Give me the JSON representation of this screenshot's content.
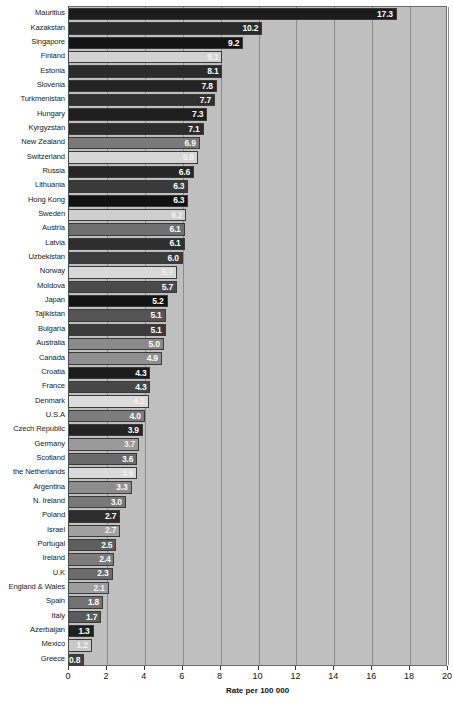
{
  "chart_data": {
    "type": "bar",
    "orientation": "horizontal",
    "title": "",
    "xlabel": "Rate per 100 000",
    "ylabel": "",
    "xlim": [
      0,
      20
    ],
    "xticks": [
      0,
      2,
      4,
      6,
      8,
      10,
      12,
      14,
      16,
      18,
      20
    ],
    "grid": true,
    "legend": "none",
    "categories": [
      "Mauritius",
      "Kazakstan",
      "Singapore",
      "Finland",
      "Estonia",
      "Slovenia",
      "Turkmenistan",
      "Hungary",
      "Kyrgyzstan",
      "New Zealand",
      "Switzerland",
      "Russia",
      "Lithuania",
      "Hong Kong",
      "Sweden",
      "Austria",
      "Latvia",
      "Uzbekistan",
      "Norway",
      "Moldova",
      "Japan",
      "Tajikistan",
      "Bulgaria",
      "Australia",
      "Canada",
      "Croatia",
      "France",
      "Denmark",
      "U.S.A",
      "Czech Republic",
      "Germany",
      "Scotland",
      "the Netherlands",
      "Argentina",
      "N. Ireland",
      "Poland",
      "Israel",
      "Portugal",
      "Ireland",
      "U.K",
      "England & Wales",
      "Spain",
      "Italy",
      "Azerbaijan",
      "Mexico",
      "Greece"
    ],
    "values": [
      17.3,
      10.2,
      9.2,
      8.1,
      8.1,
      7.8,
      7.7,
      7.3,
      7.1,
      6.9,
      6.8,
      6.6,
      6.3,
      6.3,
      6.2,
      6.1,
      6.1,
      6.0,
      5.7,
      5.7,
      5.2,
      5.1,
      5.1,
      5.0,
      4.9,
      4.3,
      4.3,
      4.2,
      4.0,
      3.9,
      3.7,
      3.6,
      3.6,
      3.3,
      3.0,
      2.7,
      2.7,
      2.5,
      2.4,
      2.3,
      2.1,
      1.8,
      1.7,
      1.3,
      1.2,
      0.8
    ],
    "value_labels": [
      "17.3",
      "10.2",
      "9.2",
      "8.1",
      "8.1",
      "7.8",
      "7.7",
      "7.3",
      "7.1",
      "6.9",
      "6.8",
      "6.6",
      "6.3",
      "6.3",
      "6.2",
      "6.1",
      "6.1",
      "6.0",
      "5.7",
      "5.7",
      "5.2",
      "5.1",
      "5.1",
      "5.0",
      "4.9",
      "4.3",
      "4.3",
      "4.2",
      "4.0",
      "3.9",
      "3.7",
      "3.6",
      "3.6",
      "3.3",
      "3.0",
      "2.7",
      "2.7",
      "2.5",
      "2.4",
      "2.3",
      "2.1",
      "1.8",
      "1.7",
      "1.3",
      "1.2",
      "0.8"
    ],
    "bar_colors": [
      "#1c1c1c",
      "#2a2a2a",
      "#141414",
      "#d2d2d2",
      "#2b2b2b",
      "#242424",
      "#303030",
      "#1e1e1e",
      "#2c2c2c",
      "#7a7a7a",
      "#d6d6d6",
      "#262626",
      "#3a3a3a",
      "#111111",
      "#cfcfcf",
      "#6f6f6f",
      "#2e2e2e",
      "#3c3c3c",
      "#d9d9d9",
      "#4a4a4a",
      "#121212",
      "#555555",
      "#3b3b3b",
      "#8a8a8a",
      "#8f8f8f",
      "#1b1b1b",
      "#474747",
      "#dcdcdc",
      "#7d7d7d",
      "#232323",
      "#9a9a9a",
      "#6a6a6a",
      "#dadada",
      "#8d8d8d",
      "#787878",
      "#2d2d2d",
      "#a0a0a0",
      "#5e5e5e",
      "#7c7c7c",
      "#6b6b6b",
      "#9d9d9d",
      "#727272",
      "#5a5a5a",
      "#1f1f1f",
      "#c8c8c8",
      "#3f3f3f"
    ]
  },
  "axis": {
    "x_title": "Rate per 100 000",
    "x_tick_labels": [
      "0",
      "2",
      "4",
      "6",
      "8",
      "10",
      "12",
      "14",
      "16",
      "18",
      "20"
    ]
  },
  "colors": {
    "plot_background": "#bfbfbf",
    "gridline": "#8c8c8c",
    "axis": "#4a4a4a",
    "value_label_text": "#ffffff"
  }
}
